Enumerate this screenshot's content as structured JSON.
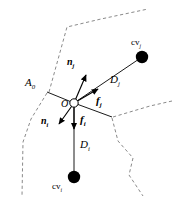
{
  "figure": {
    "background_color": "#ffffff",
    "line_color": "#000000",
    "dashed_color": "#8a8a8a",
    "width": 174,
    "height": 202
  },
  "nodes": {
    "origin": {
      "label": "O",
      "x": 74,
      "y": 103,
      "style": "open-circle"
    },
    "cv_j": {
      "label": "cv",
      "subscript": "j",
      "x": 142,
      "y": 57,
      "style": "filled-circle"
    },
    "cv_i": {
      "label": "cv",
      "subscript": "i",
      "x": 74,
      "y": 177,
      "style": "filled-circle"
    }
  },
  "labels": {
    "face_area": {
      "text": "A",
      "subscript": "0",
      "x": 27,
      "y": 83
    },
    "origin": {
      "text": "O",
      "x": 62,
      "y": 104
    },
    "normal_j": {
      "text": "n",
      "subscript": "j",
      "x": 69,
      "y": 63
    },
    "normal_i": {
      "text": "n",
      "subscript": "i",
      "x": 43,
      "y": 122
    },
    "force_j": {
      "text": "f",
      "subscript": "j",
      "x": 97,
      "y": 100
    },
    "force_i": {
      "text": "f",
      "subscript": "i",
      "x": 80,
      "y": 120
    },
    "distance_j": {
      "text": "D",
      "subscript": "j",
      "x": 112,
      "y": 80
    },
    "distance_i": {
      "text": "D",
      "subscript": "i",
      "x": 81,
      "y": 145
    },
    "cv_j": {
      "text": "cv",
      "subscript": "j",
      "x": 133,
      "y": 43
    },
    "cv_i": {
      "text": "cv",
      "subscript": "i",
      "x": 55,
      "y": 187
    }
  },
  "vectors": [
    {
      "name": "normal-j",
      "from": [
        74,
        103
      ],
      "to": [
        86,
        73
      ],
      "arrow": true
    },
    {
      "name": "force-j",
      "from": [
        74,
        103
      ],
      "to": [
        99,
        88
      ],
      "arrow": true
    },
    {
      "name": "normal-i",
      "from": [
        74,
        103
      ],
      "to": [
        58,
        126
      ],
      "arrow": true
    },
    {
      "name": "force-i",
      "from": [
        74,
        103
      ],
      "to": [
        74,
        131
      ],
      "arrow": true
    }
  ],
  "connectors": [
    {
      "name": "distance-j-line",
      "from": [
        74,
        103
      ],
      "to": [
        142,
        57
      ]
    },
    {
      "name": "distance-i-line",
      "from": [
        74,
        103
      ],
      "to": [
        74,
        177
      ]
    },
    {
      "name": "face-edge-left",
      "from": [
        74,
        103
      ],
      "to": [
        47,
        92
      ]
    },
    {
      "name": "face-edge-right",
      "from": [
        74,
        103
      ],
      "to": [
        112,
        117
      ]
    }
  ],
  "boundaries": [
    {
      "name": "boundary-upper-left",
      "points": "49,92 67,27 101,19 148,9"
    },
    {
      "name": "boundary-left-lower",
      "points": "47,93 31,119 23,142 22,196"
    },
    {
      "name": "boundary-right-upper",
      "points": "113,117 150,106 172,101"
    },
    {
      "name": "boundary-right-lower",
      "points": "112,118 118,141 133,158 129,175 143,196"
    }
  ]
}
